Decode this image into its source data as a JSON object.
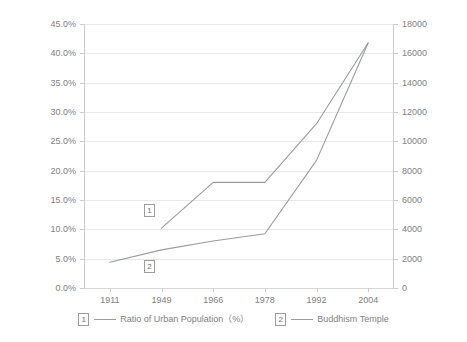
{
  "chart_data": {
    "type": "line",
    "title": "",
    "xlabel": "",
    "ylabel": "",
    "grid": true,
    "legend_position": "bottom",
    "categories": [
      "1911",
      "1949",
      "1966",
      "1978",
      "1992",
      "2004"
    ],
    "axes": {
      "left": {
        "label": "Ratio of Urban Population（%）",
        "ticks": [
          "0.0%",
          "5.0%",
          "10.0%",
          "15.0%",
          "20.0%",
          "25.0%",
          "30.0%",
          "35.0%",
          "40.0%",
          "45.0%"
        ],
        "min": 0,
        "max": 45,
        "step": 5,
        "unit": "%"
      },
      "right": {
        "label": "Buddhism Temple",
        "ticks": [
          "0",
          "2000",
          "4000",
          "6000",
          "8000",
          "10000",
          "12000",
          "14000",
          "16000",
          "18000"
        ],
        "min": 0,
        "max": 18000,
        "step": 2000,
        "unit": ""
      }
    },
    "series": [
      {
        "key": "1",
        "name": "Ratio of Urban Population（%）",
        "axis": "left",
        "color": "#9a9c9e",
        "x": [
          "1949",
          "1966",
          "1978",
          "1992",
          "2004"
        ],
        "values": [
          10.2,
          18.0,
          18.0,
          28.0,
          41.8
        ]
      },
      {
        "key": "2",
        "name": "Buddhism Temple",
        "axis": "right",
        "color": "#9a9c9e",
        "x": [
          "1911",
          "1949",
          "1966",
          "1978",
          "1992",
          "2004"
        ],
        "values": [
          1750,
          2600,
          3200,
          3700,
          8700,
          16700
        ]
      }
    ],
    "annotations": [
      {
        "text": "1",
        "series": "1",
        "x_px": 144,
        "y_px": 204
      },
      {
        "text": "2",
        "series": "2",
        "x_px": 144,
        "y_px": 260
      }
    ]
  },
  "legend": {
    "entries": [
      {
        "key": "1",
        "label": "Ratio of Urban Population（%）"
      },
      {
        "key": "2",
        "label": "Buddhism Temple"
      }
    ]
  }
}
